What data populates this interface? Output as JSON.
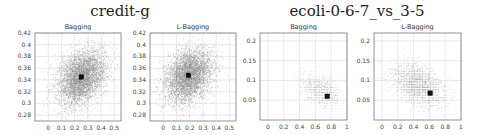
{
  "groups": [
    {
      "title": "credit-g",
      "center_x": 120
    },
    {
      "title": "ecoli-0-6-7_vs_3-5",
      "center_x": 357
    }
  ],
  "chart_data": [
    {
      "type": "scatter",
      "group": "credit-g",
      "title": "Bagging",
      "xlabel": "",
      "ylabel": "",
      "xlim": [
        -0.1,
        0.55
      ],
      "ylim": [
        0.27,
        0.42
      ],
      "xticks": [
        0,
        0.1,
        0.2,
        0.3,
        0.4,
        0.5
      ],
      "yticks": [
        0.28,
        0.3,
        0.32,
        0.34,
        0.36,
        0.38,
        0.4,
        0.42
      ],
      "grid": true,
      "cloud": {
        "center": [
          0.25,
          0.345
        ],
        "spread": [
          0.09,
          0.028
        ],
        "tilt": -0.55,
        "density": "dense",
        "color": "#8a8a8a"
      },
      "marker": {
        "x": 0.25,
        "y": 0.345,
        "shape": "square",
        "color": "#111111"
      }
    },
    {
      "type": "scatter",
      "group": "credit-g",
      "title": "L-Bagging",
      "xlabel": "",
      "ylabel": "",
      "xlim": [
        -0.1,
        0.55
      ],
      "ylim": [
        0.27,
        0.42
      ],
      "xticks": [
        0,
        0.1,
        0.2,
        0.3,
        0.4,
        0.5
      ],
      "yticks": [
        0.28,
        0.3,
        0.32,
        0.34,
        0.36,
        0.38,
        0.4,
        0.42
      ],
      "grid": true,
      "cloud": {
        "center": [
          0.19,
          0.348
        ],
        "spread": [
          0.09,
          0.028
        ],
        "tilt": -0.55,
        "density": "dense",
        "color": "#8a8a8a"
      },
      "marker": {
        "x": 0.19,
        "y": 0.348,
        "shape": "square",
        "color": "#111111"
      }
    },
    {
      "type": "scatter",
      "group": "ecoli-0-6-7_vs_3-5",
      "title": "Bagging",
      "xlabel": "",
      "ylabel": "",
      "xlim": [
        -0.1,
        1.0
      ],
      "ylim": [
        0.0,
        0.22
      ],
      "xticks": [
        0,
        0.2,
        0.4,
        0.6,
        0.8,
        1
      ],
      "yticks": [
        0.05,
        0.1,
        0.15,
        0.2
      ],
      "grid": true,
      "cloud": {
        "center": [
          0.66,
          0.075
        ],
        "spread": [
          0.16,
          0.02
        ],
        "tilt": -0.6,
        "density": "sparse",
        "color": "#b5b5b5"
      },
      "marker": {
        "x": 0.75,
        "y": 0.06,
        "shape": "square",
        "color": "#111111"
      }
    },
    {
      "type": "scatter",
      "group": "ecoli-0-6-7_vs_3-5",
      "title": "L-Bagging",
      "xlabel": "",
      "ylabel": "",
      "xlim": [
        -0.1,
        1.0
      ],
      "ylim": [
        0.0,
        0.22
      ],
      "xticks": [
        0,
        0.2,
        0.4,
        0.6,
        0.8,
        1
      ],
      "yticks": [
        0.05,
        0.1,
        0.15,
        0.2
      ],
      "grid": true,
      "cloud": {
        "center": [
          0.45,
          0.09
        ],
        "spread": [
          0.22,
          0.028
        ],
        "tilt": -0.55,
        "density": "medium",
        "color": "#a5a5a5"
      },
      "marker": {
        "x": 0.61,
        "y": 0.068,
        "shape": "square",
        "color": "#111111"
      }
    }
  ],
  "layout": {
    "panels": [
      {
        "left": 35,
        "top": 33,
        "width": 86,
        "height": 88
      },
      {
        "left": 150,
        "top": 33,
        "width": 86,
        "height": 88
      },
      {
        "left": 260,
        "top": 33,
        "width": 87,
        "height": 87
      },
      {
        "left": 374,
        "top": 33,
        "width": 87,
        "height": 87
      }
    ]
  }
}
